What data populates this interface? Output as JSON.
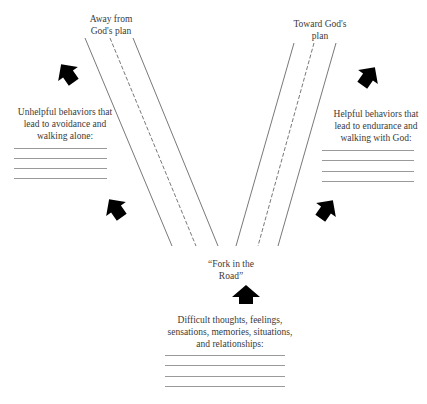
{
  "diagram": {
    "top_left_label": [
      "Away from",
      "God's plan"
    ],
    "top_right_label": [
      "Toward God's",
      "plan"
    ],
    "left_box": {
      "text": [
        "Unhelpful behaviors that",
        "lead to avoidance and",
        "walking alone:"
      ],
      "blank_lines": 4
    },
    "right_box": {
      "text": [
        "Helpful behaviors that",
        "lead to endurance and",
        "walking with God:"
      ],
      "blank_lines": 4
    },
    "fork_label": [
      "“Fork in the",
      "Road”"
    ],
    "bottom_box": {
      "text": [
        "Difficult thoughts, feelings,",
        "sensations, memories, situations,",
        "and relationships:"
      ],
      "blank_lines": 4
    },
    "icons": [
      "arrow-up-left-icon",
      "arrow-up-left-icon",
      "arrow-up-right-icon",
      "arrow-up-right-icon",
      "arrow-up-icon"
    ],
    "colors": {
      "line": "#555555",
      "arrow": "#000000",
      "text": "#3a3a3a",
      "blank_line": "#9a9a9a"
    }
  }
}
